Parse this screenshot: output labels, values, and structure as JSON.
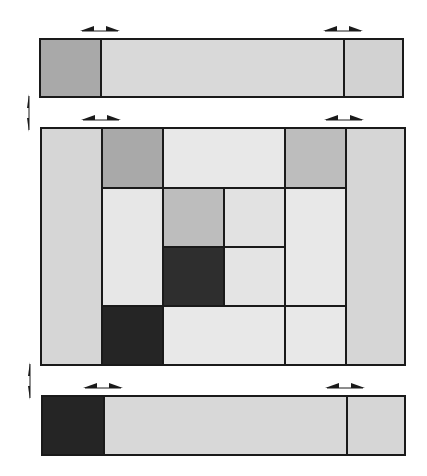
{
  "diagram": {
    "title": "",
    "colors": {
      "dark": "#2c2c2c",
      "medium": "#a9a9a9",
      "medium_light": "#bdbdbd",
      "light": "#d7d7d7",
      "very_light": "#e7e7e7",
      "border": "#1a1a1a"
    },
    "top_bar": {
      "cells": [
        {
          "name": "top-bar-left-cell",
          "shade": "medium"
        },
        {
          "name": "top-bar-middle-cell",
          "shade": "light"
        },
        {
          "name": "top-bar-right-cell",
          "shade": "light"
        }
      ]
    },
    "main_grid": {
      "columns": 6,
      "rows": 4,
      "cells": [
        {
          "name": "left-column",
          "col": 1,
          "row": 1,
          "col_span": 1,
          "row_span": 4,
          "shade": "light"
        },
        {
          "name": "cell-r1-c2",
          "col": 2,
          "row": 1,
          "col_span": 1,
          "row_span": 1,
          "shade": "medium"
        },
        {
          "name": "cell-r1-c3-c4",
          "col": 3,
          "row": 1,
          "col_span": 2,
          "row_span": 1,
          "shade": "very_light"
        },
        {
          "name": "cell-r1-c5",
          "col": 5,
          "row": 1,
          "col_span": 1,
          "row_span": 1,
          "shade": "medium_light"
        },
        {
          "name": "right-column",
          "col": 6,
          "row": 1,
          "col_span": 1,
          "row_span": 4,
          "shade": "light"
        },
        {
          "name": "cell-r2-r3-c2",
          "col": 2,
          "row": 2,
          "col_span": 1,
          "row_span": 2,
          "shade": "very_light"
        },
        {
          "name": "cell-r2-c3",
          "col": 3,
          "row": 2,
          "col_span": 1,
          "row_span": 1,
          "shade": "medium_light"
        },
        {
          "name": "cell-r2-c4",
          "col": 4,
          "row": 2,
          "col_span": 1,
          "row_span": 1,
          "shade": "very_light"
        },
        {
          "name": "cell-r2-r3-c5",
          "col": 5,
          "row": 2,
          "col_span": 1,
          "row_span": 2,
          "shade": "very_light"
        },
        {
          "name": "cell-r3-c3",
          "col": 3,
          "row": 3,
          "col_span": 1,
          "row_span": 1,
          "shade": "dark"
        },
        {
          "name": "cell-r3-c4",
          "col": 4,
          "row": 3,
          "col_span": 1,
          "row_span": 1,
          "shade": "very_light"
        },
        {
          "name": "cell-r4-c2",
          "col": 2,
          "row": 4,
          "col_span": 1,
          "row_span": 1,
          "shade": "dark"
        },
        {
          "name": "cell-r4-c3-c4",
          "col": 3,
          "row": 4,
          "col_span": 2,
          "row_span": 1,
          "shade": "very_light"
        },
        {
          "name": "cell-r4-c5",
          "col": 5,
          "row": 4,
          "col_span": 1,
          "row_span": 1,
          "shade": "very_light"
        }
      ]
    },
    "bottom_bar": {
      "cells": [
        {
          "name": "bottom-bar-left-cell",
          "shade": "dark"
        },
        {
          "name": "bottom-bar-middle-cell",
          "shade": "light"
        },
        {
          "name": "bottom-bar-right-cell",
          "shade": "light"
        }
      ]
    },
    "arrows": [
      {
        "name": "top-bar-left-double-arrow",
        "orientation": "horizontal"
      },
      {
        "name": "top-bar-right-double-arrow",
        "orientation": "horizontal"
      },
      {
        "name": "top-gap-vertical-double-arrow",
        "orientation": "vertical"
      },
      {
        "name": "grid-left-double-arrow",
        "orientation": "horizontal"
      },
      {
        "name": "grid-right-double-arrow",
        "orientation": "horizontal"
      },
      {
        "name": "bottom-gap-vertical-double-arrow",
        "orientation": "vertical"
      },
      {
        "name": "bottom-bar-left-double-arrow",
        "orientation": "horizontal"
      },
      {
        "name": "bottom-bar-right-double-arrow",
        "orientation": "horizontal"
      }
    ]
  }
}
